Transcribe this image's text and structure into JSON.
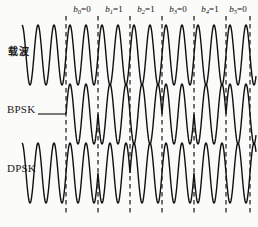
{
  "figure": {
    "background_color": "#fbfbfa",
    "stroke_color": "#111111",
    "dash_color": "#1a1a1a",
    "width": 258,
    "height": 227
  },
  "row_labels": {
    "carrier": "载波",
    "bpsk": "BPSK",
    "dpsk": "DPSK"
  },
  "bits": [
    {
      "name": "b",
      "index": "0",
      "value": "0",
      "label": "b0=0",
      "x": 82
    },
    {
      "name": "b",
      "index": "1",
      "value": "1",
      "label": "b1=1",
      "x": 114
    },
    {
      "name": "b",
      "index": "2",
      "value": "1",
      "label": "b2=1",
      "x": 146
    },
    {
      "name": "b",
      "index": "3",
      "value": "0",
      "label": "b3=0",
      "x": 178
    },
    {
      "name": "b",
      "index": "4",
      "value": "1",
      "label": "b4=1",
      "x": 210
    },
    {
      "name": "b",
      "index": "5",
      "value": "0",
      "label": "b5=0",
      "x": 238
    }
  ],
  "chart_data": {
    "type": "line",
    "xlabel": "",
    "ylabel": "",
    "grid": false,
    "legend": "none",
    "bit_sequence": [
      0,
      1,
      1,
      0,
      1,
      0
    ],
    "bit_labels": [
      "b0=0",
      "b1=1",
      "b2=1",
      "b3=0",
      "b4=1",
      "b5=0"
    ],
    "boundary_x": [
      66,
      98,
      130,
      162,
      194,
      226,
      250
    ],
    "series": [
      {
        "name": "载波",
        "row": "carrier",
        "description": "Unmodulated continuous sine carrier of constant phase",
        "phases": [
          0,
          0,
          0,
          0,
          0,
          0
        ],
        "x_start": 22,
        "x_end": 256,
        "baseline_y": 55,
        "amplitude": 30,
        "cycles_per_bit": 2
      },
      {
        "name": "BPSK",
        "row": "bpsk",
        "description": "Absolute phase shift keying: phase 0 for bit 0, phase 180 for bit 1",
        "phases": [
          0,
          180,
          180,
          0,
          180,
          0
        ],
        "x_start": 66,
        "x_end": 256,
        "baseline_y": 114,
        "amplitude": 30,
        "cycles_per_bit": 2
      },
      {
        "name": "DPSK",
        "row": "dpsk",
        "description": "Differential phase shift keying: phase inverts when bit is 1",
        "phases": [
          0,
          180,
          0,
          0,
          180,
          180
        ],
        "x_start": 22,
        "x_end": 256,
        "baseline_y": 173,
        "amplitude": 30,
        "cycles_per_bit": 2
      }
    ]
  }
}
